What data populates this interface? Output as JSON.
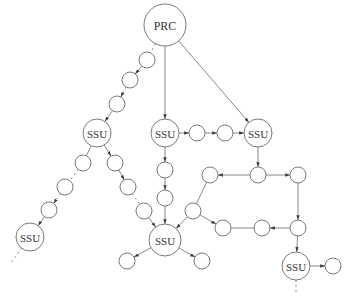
{
  "colors": {
    "stroke": "#6b6b6b",
    "text": "#333333",
    "background": "#ffffff"
  },
  "nodes": [
    {
      "id": "prc",
      "label": "PRC",
      "x": 165,
      "y": 25,
      "r": 21
    },
    {
      "id": "ssu_l",
      "label": "SSU",
      "x": 97,
      "y": 133,
      "r": 14
    },
    {
      "id": "ssu_m",
      "label": "SSU",
      "x": 165,
      "y": 133,
      "r": 14
    },
    {
      "id": "ssu_r",
      "label": "SSU",
      "x": 258,
      "y": 133,
      "r": 14
    },
    {
      "id": "ssu_bl",
      "label": "SSU",
      "x": 30,
      "y": 237,
      "r": 14
    },
    {
      "id": "ssu_c",
      "label": "SSU",
      "x": 165,
      "y": 240,
      "r": 16
    },
    {
      "id": "ssu_br",
      "label": "SSU",
      "x": 296,
      "y": 266,
      "r": 14
    },
    {
      "id": "a1",
      "label": "",
      "x": 147,
      "y": 60,
      "r": 8
    },
    {
      "id": "a2",
      "label": "",
      "x": 130,
      "y": 80,
      "r": 8
    },
    {
      "id": "a3",
      "label": "",
      "x": 117,
      "y": 104,
      "r": 8
    },
    {
      "id": "b1",
      "label": "",
      "x": 197,
      "y": 133,
      "r": 8
    },
    {
      "id": "b2",
      "label": "",
      "x": 225,
      "y": 133,
      "r": 8
    },
    {
      "id": "c1",
      "label": "",
      "x": 165,
      "y": 170,
      "r": 8
    },
    {
      "id": "c2",
      "label": "",
      "x": 165,
      "y": 198,
      "r": 8
    },
    {
      "id": "d1",
      "label": "",
      "x": 83,
      "y": 163,
      "r": 8
    },
    {
      "id": "d2",
      "label": "",
      "x": 65,
      "y": 187,
      "r": 8
    },
    {
      "id": "d3",
      "label": "",
      "x": 49,
      "y": 210,
      "r": 8
    },
    {
      "id": "e1",
      "label": "",
      "x": 115,
      "y": 163,
      "r": 8
    },
    {
      "id": "e2",
      "label": "",
      "x": 128,
      "y": 187,
      "r": 8
    },
    {
      "id": "e3",
      "label": "",
      "x": 144,
      "y": 211,
      "r": 8
    },
    {
      "id": "f1",
      "label": "",
      "x": 258,
      "y": 175,
      "r": 8
    },
    {
      "id": "f2",
      "label": "",
      "x": 210,
      "y": 175,
      "r": 8
    },
    {
      "id": "f3",
      "label": "",
      "x": 298,
      "y": 175,
      "r": 8
    },
    {
      "id": "f4",
      "label": "",
      "x": 193,
      "y": 211,
      "r": 8
    },
    {
      "id": "f5",
      "label": "",
      "x": 223,
      "y": 228,
      "r": 8
    },
    {
      "id": "f6",
      "label": "",
      "x": 262,
      "y": 228,
      "r": 8
    },
    {
      "id": "f7",
      "label": "",
      "x": 298,
      "y": 228,
      "r": 8
    },
    {
      "id": "g1",
      "label": "",
      "x": 127,
      "y": 261,
      "r": 8
    },
    {
      "id": "g2",
      "label": "",
      "x": 202,
      "y": 261,
      "r": 8
    },
    {
      "id": "h1",
      "label": "",
      "x": 333,
      "y": 266,
      "r": 8
    }
  ],
  "edges": [
    {
      "from": "prc",
      "to": "a1",
      "arrow": false,
      "dashed": true
    },
    {
      "from": "a1",
      "to": "a2",
      "arrow": true
    },
    {
      "from": "a2",
      "to": "a3",
      "arrow": true,
      "dashed": true
    },
    {
      "from": "a3",
      "to": "ssu_l",
      "arrow": true
    },
    {
      "from": "prc",
      "to": "ssu_m",
      "arrow": true
    },
    {
      "from": "prc",
      "to": "ssu_r",
      "arrow": true
    },
    {
      "from": "ssu_m",
      "to": "b1",
      "arrow": true
    },
    {
      "from": "b1",
      "to": "b2",
      "arrow": true
    },
    {
      "from": "b2",
      "to": "ssu_r",
      "arrow": true
    },
    {
      "from": "ssu_m",
      "to": "c1",
      "arrow": true
    },
    {
      "from": "c1",
      "to": "c2",
      "arrow": true
    },
    {
      "from": "c2",
      "to": "ssu_c",
      "arrow": true
    },
    {
      "from": "ssu_l",
      "to": "d1",
      "arrow": false
    },
    {
      "from": "d1",
      "to": "d2",
      "arrow": false,
      "dashed": true
    },
    {
      "from": "d2",
      "to": "d3",
      "arrow": true,
      "dashed": true
    },
    {
      "from": "d3",
      "to": "ssu_bl",
      "arrow": true
    },
    {
      "from": "ssu_l",
      "to": "e1",
      "arrow": true
    },
    {
      "from": "e1",
      "to": "e2",
      "arrow": true
    },
    {
      "from": "e2",
      "to": "e3",
      "arrow": false,
      "dashed": true
    },
    {
      "from": "e3",
      "to": "ssu_c",
      "arrow": true
    },
    {
      "from": "ssu_r",
      "to": "f1",
      "arrow": true
    },
    {
      "from": "f1",
      "to": "f2",
      "arrow": true
    },
    {
      "from": "f1",
      "to": "f3",
      "arrow": true
    },
    {
      "from": "f2",
      "to": "f4",
      "arrow": false
    },
    {
      "from": "f4",
      "to": "ssu_c",
      "arrow": true
    },
    {
      "from": "f4",
      "to": "f5",
      "arrow": true
    },
    {
      "from": "f5",
      "to": "f6",
      "arrow": false
    },
    {
      "from": "f7",
      "to": "f6",
      "arrow": true
    },
    {
      "from": "f3",
      "to": "f7",
      "arrow": true
    },
    {
      "from": "f7",
      "to": "ssu_br",
      "arrow": true
    },
    {
      "from": "ssu_br",
      "to": "h1",
      "arrow": true
    },
    {
      "from": "ssu_c",
      "to": "g1",
      "arrow": true
    },
    {
      "from": "ssu_c",
      "to": "g2",
      "arrow": true
    }
  ],
  "continuations": [
    {
      "from": "ssu_bl",
      "x2": 10,
      "y2": 264
    },
    {
      "from": "ssu_br",
      "x2": 296,
      "y2": 294
    }
  ]
}
